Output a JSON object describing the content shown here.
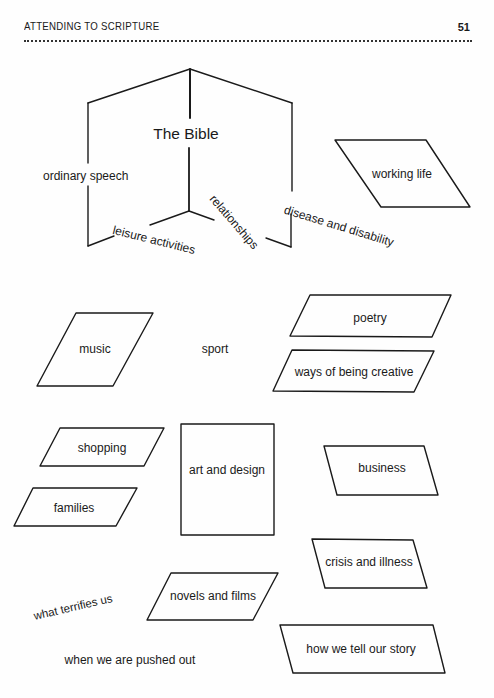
{
  "header": {
    "running_head": "ATTENDING TO SCRIPTURE",
    "page_number": "51"
  },
  "diagram": {
    "book": {
      "title": "The Bible",
      "left_page_label": "ordinary speech",
      "bottom_left_label": "leisure activities",
      "bottom_right_label": "relationships",
      "right_page_label": "disease and disability"
    },
    "boxes": {
      "working_life": "working life",
      "music": "music",
      "poetry": "poetry",
      "ways_of_being_creative": "ways of being creative",
      "shopping": "shopping",
      "families": "families",
      "art_and_design": "art and design",
      "business": "business",
      "crisis_and_illness": "crisis and illness",
      "novels_and_films": "novels and films",
      "how_we_tell_our_story": "how we tell our story"
    },
    "free_labels": {
      "sport": "sport",
      "what_terrifies_us": "what terrifies us",
      "when_we_are_pushed_out": "when we are pushed out"
    }
  }
}
